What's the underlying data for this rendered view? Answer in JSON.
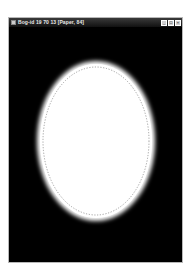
{
  "window": {
    "title": "Bog-id 19 70 13 [Paper, 84]",
    "controls": {
      "minimize": "_",
      "maximize": "□",
      "close": "×"
    }
  },
  "canvas": {
    "background_color": "#000000",
    "shape": {
      "type": "ellipse",
      "fill_color": "#ffffff",
      "glow_color": "#ffffff",
      "outline_style": "dotted",
      "outline_color": "#8a8a8a"
    }
  }
}
